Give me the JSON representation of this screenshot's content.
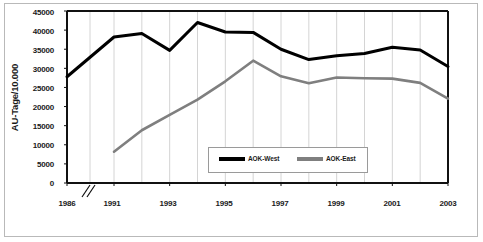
{
  "chart_data": {
    "type": "line",
    "title": "",
    "xlabel": "",
    "ylabel": "AU-Tage/10.000",
    "ylim": [
      0,
      45000
    ],
    "ytick_labels": [
      "45000",
      "40000",
      "35000",
      "30000",
      "25000",
      "20000",
      "15000",
      "10000",
      "5000",
      "0"
    ],
    "ytick_values": [
      45000,
      40000,
      35000,
      30000,
      25000,
      20000,
      15000,
      10000,
      5000,
      0
    ],
    "x": [
      1986,
      1991,
      1992,
      1993,
      1994,
      1995,
      1996,
      1997,
      1998,
      1999,
      2000,
      2001,
      2002,
      2003
    ],
    "xtick_labels": [
      "1986",
      "1991",
      "1993",
      "1995",
      "1997",
      "1999",
      "2001",
      "2003"
    ],
    "xtick_values": [
      1986,
      1991,
      1993,
      1995,
      1997,
      1999,
      2001,
      2003
    ],
    "axis_break_marker": "//",
    "grid": "vertical-only",
    "legend_position": "inside-bottom-center",
    "series": [
      {
        "name": "AOK-West",
        "color": "#000000",
        "values": [
          27800,
          38200,
          39100,
          34700,
          42000,
          39500,
          39400,
          35000,
          32300,
          33300,
          33900,
          35500,
          34800,
          30500
        ]
      },
      {
        "name": "AOK-East",
        "color": "#7f7f7f",
        "values": [
          null,
          8200,
          13800,
          17800,
          21800,
          26600,
          32000,
          27900,
          26100,
          27600,
          27400,
          27300,
          26200,
          22100
        ]
      }
    ]
  },
  "legend": {
    "entries": [
      {
        "label": "AOK-West",
        "color": "#000000"
      },
      {
        "label": "AOK-East",
        "color": "#7f7f7f"
      }
    ]
  },
  "axis": {
    "break_marker": "//"
  }
}
